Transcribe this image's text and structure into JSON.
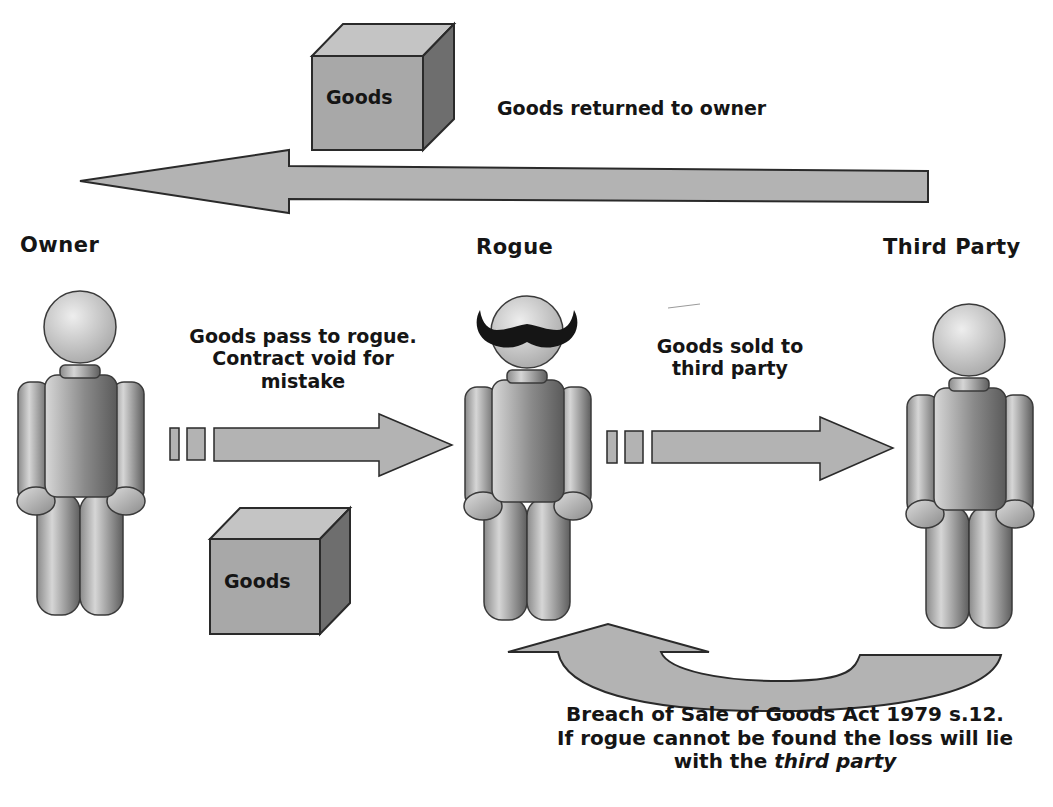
{
  "diagram": {
    "colors": {
      "background": "#ffffff",
      "arrow_fill": "#b3b3b3",
      "outline": "#2a2a2a",
      "box_front": "#a6a6a6",
      "box_top": "#bdbdbd",
      "box_side": "#6e6e6e",
      "figure_light": "#d9d9d9",
      "figure_dark": "#6a6a6a",
      "mustache": "#151515",
      "text": "#151515"
    },
    "parties": {
      "owner": "Owner",
      "rogue": "Rogue",
      "third_party": "Third Party"
    },
    "boxes": {
      "top_box": "Goods",
      "bottom_box": "Goods"
    },
    "arrows": {
      "returned": "Goods returned to owner",
      "pass_to_rogue_line1": "Goods pass to rogue.",
      "pass_to_rogue_line2": "Contract void for",
      "pass_to_rogue_line3": "mistake",
      "sold_line1": "Goods sold to",
      "sold_line2": "third party"
    },
    "footer": {
      "line1": "Breach of Sale of Goods Act 1979 s.12.",
      "line2": "If rogue cannot be found the loss will lie",
      "line3_prefix": "with the ",
      "line3_italic": "third party"
    }
  }
}
